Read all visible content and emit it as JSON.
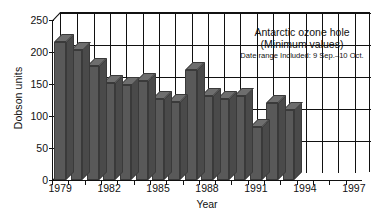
{
  "chart_data": {
    "type": "bar",
    "title": "Antarctic ozone hole",
    "subtitle": "(Minimum values)",
    "annotation": "Date range Included: 9 Sep.–10 Oct.",
    "xlabel": "Year",
    "ylabel": "Dobson units",
    "ylim": [
      0,
      250
    ],
    "yticks": [
      0,
      50,
      100,
      150,
      200,
      250
    ],
    "ytick_labels": [
      "0",
      "50",
      "100",
      "150",
      "200",
      "250"
    ],
    "xtick_labels": [
      "1979",
      "1982",
      "1985",
      "1988",
      "1991",
      "1994",
      "1997"
    ],
    "grid": true,
    "legend": "none",
    "categories": [
      "1979",
      "1980",
      "1981",
      "1982",
      "1983",
      "1984",
      "1985",
      "1986",
      "1987",
      "1988",
      "1989",
      "1990",
      "1991",
      "1992",
      "1993",
      "1994",
      "1995",
      "1996",
      "1997"
    ],
    "values": [
      215,
      203,
      178,
      152,
      148,
      155,
      127,
      122,
      172,
      132,
      127,
      132,
      83,
      120,
      110,
      0,
      0,
      0,
      0
    ],
    "series": [
      {
        "name": "Minimum ozone",
        "values": [
          215,
          203,
          178,
          152,
          148,
          155,
          127,
          122,
          172,
          132,
          127,
          132,
          83,
          120,
          110,
          0,
          0,
          0,
          0
        ]
      }
    ],
    "bars": [
      {
        "year": "1979",
        "value": 215
      },
      {
        "year": "1980",
        "value": 203
      },
      {
        "year": "1981",
        "value": 178
      },
      {
        "year": "1982",
        "value": 152
      },
      {
        "year": "1983",
        "value": 148
      },
      {
        "year": "1984",
        "value": 155
      },
      {
        "year": "1985",
        "value": 127
      },
      {
        "year": "1986",
        "value": 122
      },
      {
        "year": "1987",
        "value": 172
      },
      {
        "year": "1988",
        "value": 132
      },
      {
        "year": "1989",
        "value": 127
      },
      {
        "year": "1990",
        "value": 132
      },
      {
        "year": "1991",
        "value": 83
      },
      {
        "year": "1992",
        "value": 120
      },
      {
        "year": "1993",
        "value": 110
      }
    ],
    "colors": {
      "bar_face": "#595959",
      "bar_top": "#6e6e6e",
      "bar_side": "#4a4a4a",
      "axis": "#111111",
      "background": "#ffffff"
    }
  }
}
